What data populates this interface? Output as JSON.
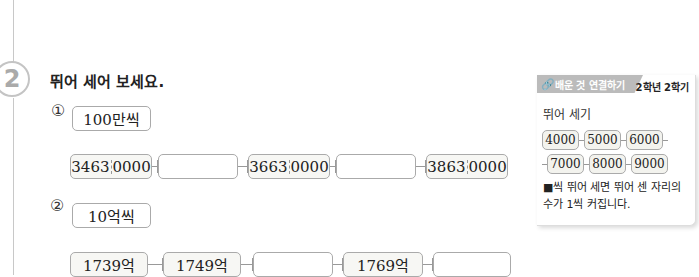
{
  "question": {
    "number": "2",
    "title": "뛰어 세어 보세요."
  },
  "part1": {
    "marker": "①",
    "step_label": "100만씩",
    "sequence": [
      {
        "front": "3463",
        "back": "0000",
        "filled": true
      },
      {
        "front": "",
        "back": "",
        "filled": false
      },
      {
        "front": "3663",
        "back": "0000",
        "filled": true
      },
      {
        "front": "",
        "back": "",
        "filled": false
      },
      {
        "front": "3863",
        "back": "0000",
        "filled": true
      }
    ]
  },
  "part2": {
    "marker": "②",
    "step_label": "10억씩",
    "sequence": [
      {
        "value": "1739억",
        "filled": true
      },
      {
        "value": "1749억",
        "filled": true
      },
      {
        "value": "",
        "filled": false
      },
      {
        "value": "1769억",
        "filled": true
      },
      {
        "value": "",
        "filled": false
      }
    ]
  },
  "sidebar": {
    "tag": "배운 것 연결하기",
    "term": "2학년 2학기",
    "heading": "뛰어 세기",
    "row1": [
      "4000",
      "5000",
      "6000"
    ],
    "row2": [
      "7000",
      "8000",
      "9000"
    ],
    "note": "■씩 뛰어 세면 뛰어 센 자리의 수가 1씩 커집니다."
  }
}
